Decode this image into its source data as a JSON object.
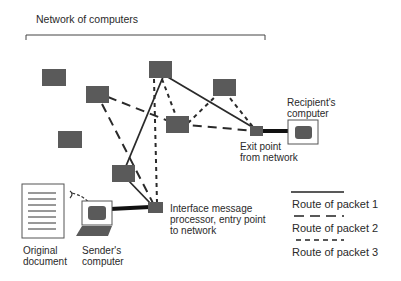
{
  "title": "Network of computers",
  "labels": {
    "recipient": "Recipient's\ncomputer",
    "exit": "Exit point\nfrom network",
    "entry": "Interface message\nprocessor, entry point\nto network",
    "original_document": "Original\ndocument",
    "sender": "Sender's\ncomputer"
  },
  "legend": [
    {
      "label": "Route of packet 1",
      "style": "solid"
    },
    {
      "label": "Route of packet 2",
      "style": "long-dash"
    },
    {
      "label": "Route of packet 3",
      "style": "short-dash"
    }
  ],
  "colors": {
    "node": "#5a5a5a",
    "line": "#2a2a2a",
    "background": "#ffffff"
  }
}
